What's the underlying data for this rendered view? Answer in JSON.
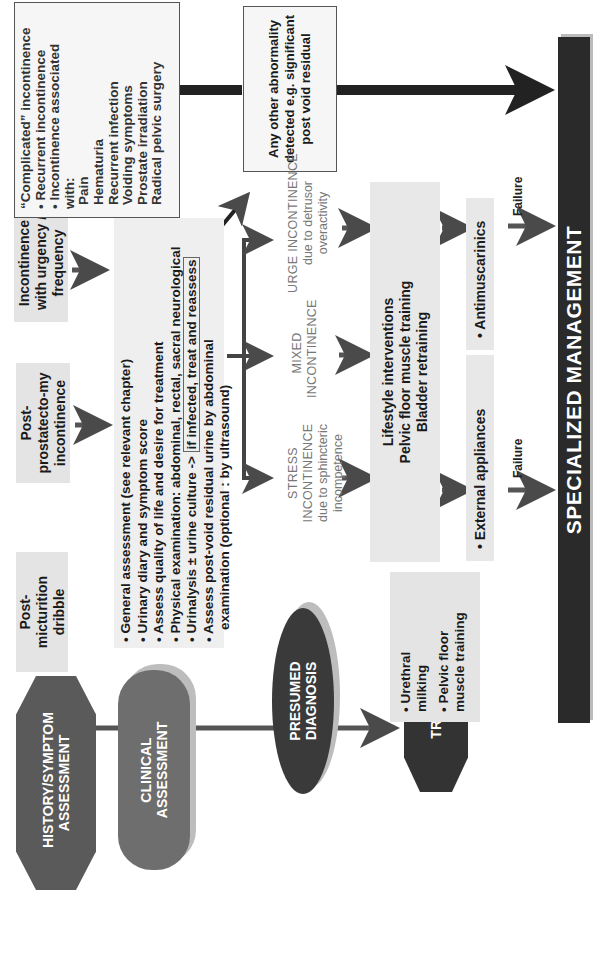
{
  "stages": {
    "history": "HISTORY/SYMPTOM ASSESSMENT",
    "clinical": "CLINICAL ASSESSMENT",
    "diagnosis": "PRESUMED DIAGNOSIS",
    "treatment": "TREATMENT"
  },
  "history": {
    "post_micturition": "Post-micturition dribble",
    "post_prostatectomy": "Post-prostatecto-my incontinence",
    "urgency": "Incontinence with urgency / frequency"
  },
  "complicated": {
    "title": "“Complicated” incontinence",
    "bullets": [
      "Recurrent incontinence",
      "Incontinence associated with:"
    ],
    "dashes": [
      "Pain",
      "Hematuria",
      "Recurrent infection",
      "Voiding symptoms",
      "Prostate irradiation",
      "Radical pelvic surgery"
    ]
  },
  "clinical": {
    "items": [
      "General assessment  (see relevant chapter)",
      "Urinary diary and symptom score",
      "Assess quality of life and desire for treatment",
      "Physical examination: abdominal, rectal, sacral neurological",
      "Urinalysis ± urine culture ->",
      "Assess post-void residual urine  by abdominal"
    ],
    "urinalysis_note": "if infected, treat and reassess",
    "continuation": "examination (optional : by ultrasound)"
  },
  "other_abnormality": "Any other abnormality detected e.g. significant post void residual",
  "diagnosis": {
    "stress": {
      "title": "STRESS  INCONTINENCE",
      "sub": "due to sphincteric incompetence"
    },
    "mixed": {
      "title": "MIXED INCONTINENCE"
    },
    "urge": {
      "title": "URGE INCONTINENCE",
      "sub": "due to detrusor overactivity"
    }
  },
  "treatment": {
    "dribble": [
      "Urethral milking",
      "Pelvic floor muscle training"
    ],
    "lifestyle": [
      "Lifestyle interventions",
      "Pelvic floor muscle training",
      "Bladder retraining"
    ],
    "external": "External appliances",
    "antimuscarinics": "Antimuscarinics",
    "failure_left": "Failure",
    "failure_right": "Failure"
  },
  "specialized": "SPECIALIZED MANAGEMENT",
  "colors": {
    "history_stage": "#5a5a5a",
    "clinical_stage": "#6e6e6e",
    "diagnosis_stage": "#3a3a3a",
    "treatment_stage": "#333333",
    "specialized_bar": "#2a2a2a",
    "grey_box": "#e4e4e4",
    "arrow": "#4a4a4a"
  }
}
